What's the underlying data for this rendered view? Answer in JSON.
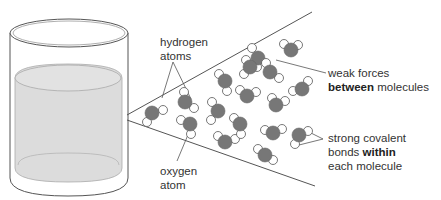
{
  "diagram": {
    "type": "water molecular structure",
    "labels": {
      "hydrogen": {
        "line1": "hydrogen",
        "line2": "atoms"
      },
      "oxygen": {
        "line1": "oxygen",
        "line2": "atom"
      },
      "weak": {
        "line1": "weak forces",
        "line2_bold": "between",
        "line2_rest": " molecules"
      },
      "strong": {
        "line1": "strong covalent",
        "line2_pre": "bonds ",
        "line2_bold": "within",
        "line3": "each molecule"
      }
    },
    "colors": {
      "oxygen": "#777777",
      "hydrogen": "#ffffff",
      "outline": "#555555",
      "liquid": "#dcdcdc",
      "line": "#555555"
    },
    "molecules": [
      {
        "x": 152,
        "y": 113,
        "h": [
          [
            163,
            110
          ],
          [
            147,
            122
          ]
        ]
      },
      {
        "x": 185,
        "y": 102,
        "h": [
          [
            184,
            92
          ],
          [
            194,
            108
          ]
        ]
      },
      {
        "x": 190,
        "y": 124,
        "h": [
          [
            181,
            120
          ],
          [
            191,
            134
          ]
        ]
      },
      {
        "x": 218,
        "y": 111,
        "h": [
          [
            212,
            102
          ],
          [
            211,
            120
          ]
        ]
      },
      {
        "x": 225,
        "y": 81,
        "h": [
          [
            219,
            74
          ],
          [
            227,
            91
          ]
        ]
      },
      {
        "x": 225,
        "y": 142,
        "h": [
          [
            218,
            136
          ],
          [
            235,
            139
          ]
        ]
      },
      {
        "x": 247,
        "y": 96,
        "h": [
          [
            240,
            90
          ],
          [
            256,
            92
          ]
        ]
      },
      {
        "x": 240,
        "y": 124,
        "h": [
          [
            234,
            118
          ],
          [
            241,
            134
          ]
        ]
      },
      {
        "x": 258,
        "y": 58,
        "h": [
          [
            252,
            48
          ],
          [
            257,
            67
          ]
        ]
      },
      {
        "x": 270,
        "y": 72,
        "h": [
          [
            266,
            63
          ],
          [
            279,
            78
          ]
        ]
      },
      {
        "x": 291,
        "y": 50,
        "h": [
          [
            284,
            44
          ],
          [
            298,
            45
          ]
        ]
      },
      {
        "x": 276,
        "y": 105,
        "h": [
          [
            272,
            98
          ],
          [
            285,
            101
          ]
        ]
      },
      {
        "x": 302,
        "y": 89,
        "h": [
          [
            293,
            91
          ],
          [
            308,
            81
          ]
        ]
      },
      {
        "x": 273,
        "y": 133,
        "h": [
          [
            265,
            130
          ],
          [
            282,
            129
          ]
        ]
      },
      {
        "x": 299,
        "y": 135,
        "h": [
          [
            308,
            131
          ],
          [
            295,
            144
          ]
        ]
      },
      {
        "x": 265,
        "y": 155,
        "h": [
          [
            258,
            149
          ],
          [
            273,
            160
          ]
        ]
      },
      {
        "x": 250,
        "y": 67,
        "h": [
          [
            244,
            74
          ],
          [
            246,
            60
          ]
        ]
      }
    ]
  }
}
